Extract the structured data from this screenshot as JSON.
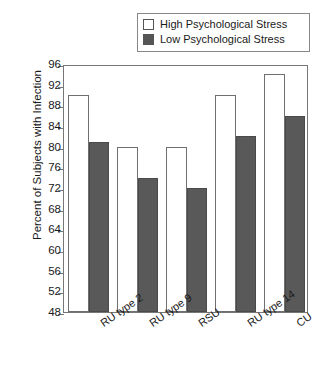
{
  "chart_data": {
    "type": "bar",
    "title": "",
    "xlabel": "",
    "ylabel": "Percent of Subjects with Infection",
    "categories": [
      "RU type 2",
      "RU type 9",
      "RSU",
      "RU type 14",
      "CU"
    ],
    "series": [
      {
        "name": "High Psychological Stress",
        "values": [
          90,
          80,
          80,
          90,
          94
        ],
        "color": "#ffffff"
      },
      {
        "name": "Low Psychological Stress",
        "values": [
          81,
          74,
          72,
          82,
          86
        ],
        "color": "#595959"
      }
    ],
    "ylim": [
      48,
      96
    ],
    "ytick_labels": [
      "96",
      "92",
      "88",
      "84",
      "80",
      "76",
      "72",
      "68",
      "64",
      "60",
      "56",
      "52",
      "48"
    ],
    "ytick_values": [
      96,
      92,
      88,
      84,
      80,
      76,
      72,
      68,
      64,
      60,
      56,
      52,
      48
    ],
    "grid": false,
    "legend_position": "top-right"
  },
  "legend": {
    "entries": [
      {
        "label": "High Psychological Stress",
        "swatch": "white-square"
      },
      {
        "label": "Low Psychological Stress",
        "swatch": "dark-gray-square"
      }
    ]
  },
  "axis": {
    "y_title": "Percent of Subjects with Infection"
  }
}
